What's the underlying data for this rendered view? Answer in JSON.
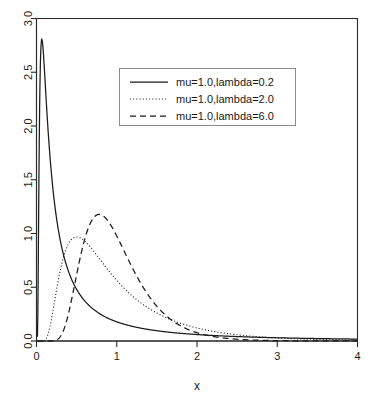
{
  "chart_data": {
    "type": "line",
    "title": "",
    "subtitle": "",
    "xlabel": "x",
    "ylabel": "",
    "xlim": [
      0,
      4
    ],
    "ylim": [
      0,
      3.0
    ],
    "xticks": [
      0,
      1,
      2,
      3,
      4
    ],
    "xtick_labels": [
      "0",
      "1",
      "2",
      "3",
      "4"
    ],
    "yticks": [
      0.0,
      0.5,
      1.0,
      1.5,
      2.0,
      2.5,
      3.0
    ],
    "ytick_labels": [
      "0.0",
      "0.5",
      "1.0",
      "1.5",
      "2.0",
      "2.5",
      "3.0"
    ],
    "grid": false,
    "legend_position": "top-center",
    "distribution": "inverse-gaussian",
    "series": [
      {
        "name": "mu=1.0,lambda=0.2",
        "mu": 1.0,
        "lambda": 0.2,
        "style": "solid",
        "color": "#1a1a1a",
        "x": [
          0.05,
          0.1,
          0.15,
          0.2,
          0.25,
          0.3,
          0.4,
          0.5,
          0.6,
          0.7,
          0.8,
          0.9,
          1.0,
          1.2,
          1.4,
          1.6,
          1.8,
          2.0,
          2.4,
          2.8,
          3.2,
          3.6,
          4.0
        ],
        "values": [
          2.62,
          1.6,
          1.14,
          0.88,
          0.72,
          0.61,
          0.46,
          0.37,
          0.31,
          0.27,
          0.23,
          0.21,
          0.19,
          0.15,
          0.13,
          0.11,
          0.1,
          0.09,
          0.07,
          0.06,
          0.05,
          0.04,
          0.04
        ]
      },
      {
        "name": "mu=1.0,lambda=2.0",
        "mu": 1.0,
        "lambda": 2.0,
        "style": "dotted",
        "color": "#1a1a1a",
        "x": [
          0.05,
          0.1,
          0.15,
          0.2,
          0.25,
          0.3,
          0.4,
          0.5,
          0.6,
          0.7,
          0.8,
          0.9,
          1.0,
          1.2,
          1.4,
          1.6,
          1.8,
          2.0,
          2.4,
          2.8,
          3.2,
          3.6,
          4.0
        ],
        "values": [
          0.0,
          0.01,
          0.1,
          0.29,
          0.53,
          0.73,
          0.94,
          0.97,
          0.92,
          0.84,
          0.76,
          0.68,
          0.6,
          0.47,
          0.37,
          0.29,
          0.23,
          0.18,
          0.12,
          0.08,
          0.05,
          0.04,
          0.03
        ]
      },
      {
        "name": "mu=1.0,lambda=6.0",
        "mu": 1.0,
        "lambda": 6.0,
        "style": "dashed",
        "color": "#1a1a1a",
        "x": [
          0.05,
          0.1,
          0.15,
          0.2,
          0.25,
          0.3,
          0.4,
          0.5,
          0.6,
          0.7,
          0.8,
          0.9,
          1.0,
          1.2,
          1.4,
          1.6,
          1.8,
          2.0,
          2.4,
          2.8,
          3.2,
          3.6,
          4.0
        ],
        "values": [
          0.0,
          0.0,
          0.0,
          0.0,
          0.02,
          0.09,
          0.41,
          0.81,
          1.08,
          1.17,
          1.16,
          1.08,
          0.98,
          0.74,
          0.53,
          0.37,
          0.25,
          0.17,
          0.07,
          0.03,
          0.01,
          0.01,
          0.0
        ]
      }
    ],
    "peaks": [
      {
        "series": "mu=1.0,lambda=2.0",
        "x": 0.52,
        "y": 0.97
      },
      {
        "series": "mu=1.0,lambda=6.0",
        "x": 0.78,
        "y": 1.18
      }
    ]
  },
  "legend": {
    "entries": [
      {
        "label": "mu=1.0,lambda=0.2",
        "style": "solid"
      },
      {
        "label": "mu=1.0,lambda=2.0",
        "style": "dotted"
      },
      {
        "label": "mu=1.0,lambda=6.0",
        "style": "dashed"
      }
    ]
  },
  "colors": {
    "ink": "#1a1a1a",
    "axis": "#2b2b2b",
    "legend_border": "#8a8a8a",
    "background": "#ffffff"
  }
}
